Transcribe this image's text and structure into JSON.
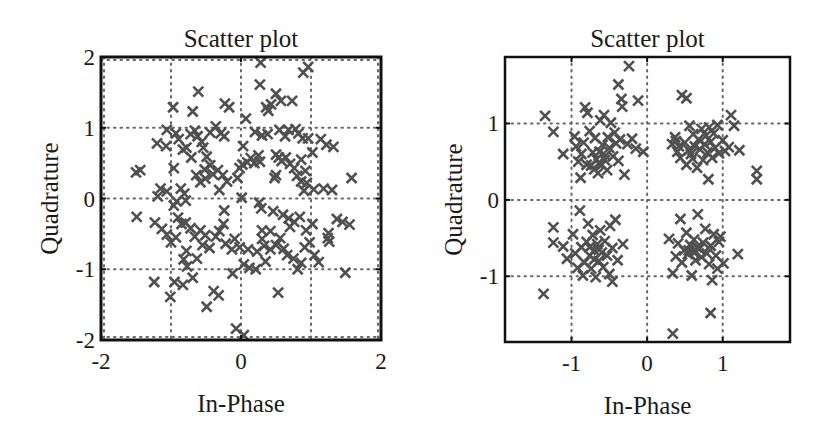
{
  "chart_data": [
    {
      "type": "scatter",
      "title": "Scatter plot",
      "xlabel": "In-Phase",
      "ylabel": "Quadrature",
      "xlim": [
        -2,
        2
      ],
      "ylim": [
        -2,
        2
      ],
      "xticks": [
        -2,
        0,
        2
      ],
      "yticks": [
        -2,
        -1,
        0,
        1,
        2
      ],
      "xtick_labels": [
        "-2",
        "0",
        "2"
      ],
      "ytick_labels": [
        "-2",
        "-1",
        "0",
        "1",
        "2"
      ],
      "grid": true,
      "grid_x": [
        -2,
        -1,
        0,
        1,
        2
      ],
      "grid_y": [
        -2,
        -1,
        0,
        1,
        2
      ],
      "grid_style": "dotted",
      "marker": "x",
      "marker_color": "#505050",
      "points": [
        [
          -0.61,
          1.51
        ],
        [
          -0.97,
          1.29
        ],
        [
          -0.69,
          1.23
        ],
        [
          -0.23,
          1.34
        ],
        [
          -0.17,
          1.29
        ],
        [
          0.07,
          1.13
        ],
        [
          0.28,
          1.92
        ],
        [
          0.89,
          1.78
        ],
        [
          0.96,
          1.86
        ],
        [
          0.27,
          1.61
        ],
        [
          0.5,
          1.48
        ],
        [
          0.57,
          1.38
        ],
        [
          0.43,
          1.33
        ],
        [
          0.39,
          1.24
        ],
        [
          0.73,
          1.38
        ],
        [
          0.36,
          1.29
        ],
        [
          -1.44,
          0.4
        ],
        [
          -1.5,
          0.37
        ],
        [
          -0.96,
          0.43
        ],
        [
          -1.06,
          0.97
        ],
        [
          -1.2,
          0.78
        ],
        [
          -1.07,
          0.74
        ],
        [
          -0.93,
          0.92
        ],
        [
          -0.89,
          0.84
        ],
        [
          -0.83,
          0.69
        ],
        [
          -0.78,
          0.72
        ],
        [
          -0.72,
          0.91
        ],
        [
          -0.66,
          0.96
        ],
        [
          -0.62,
          0.88
        ],
        [
          -0.56,
          0.8
        ],
        [
          -0.54,
          0.72
        ],
        [
          -0.71,
          0.58
        ],
        [
          -0.49,
          0.59
        ],
        [
          -0.36,
          1.02
        ],
        [
          -0.29,
          0.92
        ],
        [
          -0.24,
          0.88
        ],
        [
          -0.44,
          0.93
        ],
        [
          -0.64,
          0.33
        ],
        [
          -0.52,
          0.41
        ],
        [
          -0.44,
          0.47
        ],
        [
          -0.4,
          0.34
        ],
        [
          -0.33,
          0.4
        ],
        [
          -0.26,
          0.33
        ],
        [
          -0.2,
          0.24
        ],
        [
          -0.58,
          0.23
        ],
        [
          -0.51,
          0.28
        ],
        [
          -0.02,
          0.43
        ],
        [
          0.02,
          0.48
        ],
        [
          0.09,
          0.51
        ],
        [
          0.14,
          0.57
        ],
        [
          -0.05,
          0.29
        ],
        [
          0.03,
          0.74
        ],
        [
          0.19,
          0.5
        ],
        [
          0.25,
          0.61
        ],
        [
          0.27,
          0.52
        ],
        [
          0.2,
          0.94
        ],
        [
          0.3,
          0.89
        ],
        [
          0.38,
          0.91
        ],
        [
          0.55,
          0.97
        ],
        [
          0.63,
          0.88
        ],
        [
          0.68,
          0.97
        ],
        [
          0.78,
          0.98
        ],
        [
          0.82,
          0.92
        ],
        [
          0.88,
          0.85
        ],
        [
          0.96,
          0.85
        ],
        [
          1.14,
          0.84
        ],
        [
          1.22,
          0.76
        ],
        [
          1.32,
          0.73
        ],
        [
          1.02,
          0.65
        ],
        [
          0.5,
          0.62
        ],
        [
          0.54,
          0.58
        ],
        [
          0.58,
          0.53
        ],
        [
          0.64,
          0.58
        ],
        [
          0.7,
          0.49
        ],
        [
          0.76,
          0.43
        ],
        [
          0.86,
          0.55
        ],
        [
          0.92,
          0.39
        ],
        [
          0.8,
          0.32
        ],
        [
          0.86,
          0.24
        ],
        [
          0.94,
          0.22
        ],
        [
          1.04,
          0.13
        ],
        [
          0.9,
          0.11
        ],
        [
          1.18,
          0.14
        ],
        [
          1.3,
          0.12
        ],
        [
          0.48,
          0.29
        ],
        [
          0.5,
          0.33
        ],
        [
          1.58,
          0.29
        ],
        [
          -1.15,
          0.14
        ],
        [
          -1.19,
          0.03
        ],
        [
          -1.06,
          0.1
        ],
        [
          -0.86,
          0.14
        ],
        [
          -0.81,
          0.07
        ],
        [
          -0.79,
          -0.03
        ],
        [
          -0.92,
          -0.04
        ],
        [
          -0.96,
          -0.1
        ],
        [
          -0.31,
          0.12
        ],
        [
          0.01,
          0.01
        ],
        [
          -0.24,
          -0.17
        ],
        [
          -1.49,
          -0.26
        ],
        [
          -1.23,
          -0.34
        ],
        [
          -1.13,
          -0.43
        ],
        [
          -1.06,
          -0.51
        ],
        [
          -1.0,
          -0.62
        ],
        [
          -0.93,
          -0.55
        ],
        [
          -0.9,
          -0.27
        ],
        [
          -0.85,
          -0.36
        ],
        [
          -0.79,
          -0.34
        ],
        [
          -0.72,
          -0.42
        ],
        [
          -0.66,
          -0.54
        ],
        [
          -0.58,
          -0.45
        ],
        [
          -0.51,
          -0.52
        ],
        [
          -0.45,
          -0.7
        ],
        [
          -0.36,
          -0.54
        ],
        [
          -0.31,
          -0.46
        ],
        [
          -0.25,
          -0.36
        ],
        [
          -0.22,
          -0.64
        ],
        [
          -0.13,
          -0.72
        ],
        [
          -0.09,
          -0.57
        ],
        [
          -0.02,
          -0.69
        ],
        [
          -0.55,
          -0.66
        ],
        [
          -0.63,
          -0.85
        ],
        [
          -0.78,
          -0.74
        ],
        [
          -0.82,
          -0.86
        ],
        [
          -0.77,
          -0.96
        ],
        [
          -0.69,
          -1.12
        ],
        [
          -0.95,
          -1.18
        ],
        [
          -0.83,
          -1.22
        ],
        [
          -1.24,
          -1.18
        ],
        [
          -1.01,
          -1.39
        ],
        [
          -0.39,
          -1.31
        ],
        [
          -0.32,
          -1.37
        ],
        [
          -0.49,
          -1.53
        ],
        [
          -0.12,
          -1.06
        ],
        [
          0.04,
          -0.93
        ],
        [
          0.12,
          -0.98
        ],
        [
          0.21,
          -1.0
        ],
        [
          0.23,
          -0.75
        ],
        [
          0.1,
          -0.72
        ],
        [
          0.35,
          -0.89
        ],
        [
          0.33,
          -0.67
        ],
        [
          0.42,
          -0.72
        ],
        [
          0.5,
          -0.66
        ],
        [
          0.56,
          -0.56
        ],
        [
          0.61,
          -0.71
        ],
        [
          0.66,
          -0.8
        ],
        [
          0.75,
          -0.85
        ],
        [
          0.81,
          -1.0
        ],
        [
          0.86,
          -0.91
        ],
        [
          0.91,
          -0.69
        ],
        [
          0.98,
          -0.62
        ],
        [
          1.05,
          -0.8
        ],
        [
          1.11,
          -0.9
        ],
        [
          0.7,
          -0.4
        ],
        [
          0.76,
          -0.33
        ],
        [
          0.84,
          -0.26
        ],
        [
          0.93,
          -0.45
        ],
        [
          1.02,
          -0.36
        ],
        [
          0.6,
          -0.23
        ],
        [
          0.68,
          -0.28
        ],
        [
          0.42,
          -0.46
        ],
        [
          0.3,
          -0.45
        ],
        [
          0.46,
          -0.18
        ],
        [
          0.26,
          -0.06
        ],
        [
          0.29,
          -0.14
        ],
        [
          0.3,
          -0.57
        ],
        [
          1.25,
          -0.49
        ],
        [
          1.24,
          -0.56
        ],
        [
          1.26,
          -0.61
        ],
        [
          1.37,
          -0.29
        ],
        [
          1.45,
          -0.33
        ],
        [
          1.55,
          -0.37
        ],
        [
          1.49,
          -1.05
        ],
        [
          0.53,
          -1.33
        ],
        [
          -0.07,
          -1.84
        ],
        [
          0.04,
          -1.93
        ]
      ]
    },
    {
      "type": "scatter",
      "title": "Scatter plot",
      "xlabel": "In-Phase",
      "ylabel": "Quadrature",
      "xlim": [
        -1.88,
        1.89
      ],
      "ylim": [
        -1.86,
        1.87
      ],
      "xticks": [
        -1,
        0,
        1
      ],
      "yticks": [
        -1,
        0,
        1
      ],
      "xtick_labels": [
        "-1",
        "0",
        "1"
      ],
      "ytick_labels": [
        "-1",
        "0",
        "1"
      ],
      "grid": true,
      "grid_x": [
        -1,
        0,
        1
      ],
      "grid_y": [
        -1,
        0,
        1
      ],
      "grid_style": "dotted",
      "marker": "x",
      "marker_color": "#505050",
      "points": [
        [
          -1.35,
          1.1
        ],
        [
          -1.24,
          0.89
        ],
        [
          -1.11,
          0.6
        ],
        [
          -0.96,
          0.83
        ],
        [
          -0.94,
          0.7
        ],
        [
          -0.91,
          0.5
        ],
        [
          -0.88,
          0.29
        ],
        [
          -0.87,
          0.6
        ],
        [
          -0.84,
          0.75
        ],
        [
          -0.82,
          1.21
        ],
        [
          -0.79,
          1.14
        ],
        [
          -0.76,
          0.9
        ],
        [
          -0.72,
          0.62
        ],
        [
          -0.7,
          0.4
        ],
        [
          -0.69,
          0.81
        ],
        [
          -0.67,
          0.53
        ],
        [
          -0.65,
          0.35
        ],
        [
          -0.63,
          0.63
        ],
        [
          -0.62,
          1.04
        ],
        [
          -0.6,
          0.46
        ],
        [
          -0.59,
          0.72
        ],
        [
          -0.57,
          1.11
        ],
        [
          -0.55,
          0.58
        ],
        [
          -0.53,
          0.39
        ],
        [
          -0.52,
          0.82
        ],
        [
          -0.5,
          0.68
        ],
        [
          -0.48,
          1.01
        ],
        [
          -0.45,
          0.57
        ],
        [
          -0.43,
          0.88
        ],
        [
          -0.41,
          0.74
        ],
        [
          -0.38,
          0.51
        ],
        [
          -0.36,
          0.79
        ],
        [
          -0.34,
          1.32
        ],
        [
          -0.33,
          1.22
        ],
        [
          -0.38,
          1.51
        ],
        [
          -0.3,
          0.33
        ],
        [
          -0.26,
          0.73
        ],
        [
          -0.24,
          1.75
        ],
        [
          -0.2,
          0.8
        ],
        [
          -0.15,
          0.67
        ],
        [
          -0.12,
          1.3
        ],
        [
          -0.05,
          0.63
        ],
        [
          -0.8,
          0.46
        ],
        [
          -0.74,
          0.45
        ],
        [
          -0.64,
          0.48
        ],
        [
          -0.56,
          0.52
        ],
        [
          0.33,
          0.73
        ],
        [
          0.37,
          0.82
        ],
        [
          0.4,
          0.63
        ],
        [
          0.44,
          0.55
        ],
        [
          0.46,
          1.37
        ],
        [
          0.52,
          1.33
        ],
        [
          0.5,
          0.75
        ],
        [
          0.52,
          0.46
        ],
        [
          0.56,
          0.97
        ],
        [
          0.58,
          0.6
        ],
        [
          0.61,
          0.86
        ],
        [
          0.63,
          0.7
        ],
        [
          0.66,
          0.42
        ],
        [
          0.68,
          0.79
        ],
        [
          0.7,
          0.66
        ],
        [
          0.72,
          0.93
        ],
        [
          0.74,
          0.52
        ],
        [
          0.76,
          0.73
        ],
        [
          0.78,
          0.84
        ],
        [
          0.8,
          0.62
        ],
        [
          0.82,
          0.95
        ],
        [
          0.84,
          0.76
        ],
        [
          0.86,
          0.55
        ],
        [
          0.88,
          0.87
        ],
        [
          0.9,
          0.68
        ],
        [
          0.93,
          0.98
        ],
        [
          0.95,
          0.61
        ],
        [
          1.0,
          0.78
        ],
        [
          1.03,
          0.64
        ],
        [
          1.08,
          0.69
        ],
        [
          1.11,
          1.11
        ],
        [
          1.15,
          0.97
        ],
        [
          1.22,
          0.65
        ],
        [
          0.81,
          0.27
        ],
        [
          1.45,
          0.38
        ],
        [
          1.45,
          0.27
        ],
        [
          0.38,
          0.77
        ],
        [
          0.42,
          0.7
        ],
        [
          0.6,
          0.54
        ],
        [
          0.55,
          0.65
        ],
        [
          -1.37,
          -1.23
        ],
        [
          -1.24,
          -0.36
        ],
        [
          -1.24,
          -0.56
        ],
        [
          -1.11,
          -0.61
        ],
        [
          -1.06,
          -0.77
        ],
        [
          -0.98,
          -0.45
        ],
        [
          -0.95,
          -0.7
        ],
        [
          -0.92,
          -0.89
        ],
        [
          -0.89,
          -0.14
        ],
        [
          -0.87,
          -0.62
        ],
        [
          -0.85,
          -0.99
        ],
        [
          -0.83,
          -0.82
        ],
        [
          -0.8,
          -0.55
        ],
        [
          -0.78,
          -0.31
        ],
        [
          -0.76,
          -0.73
        ],
        [
          -0.74,
          -0.9
        ],
        [
          -0.72,
          -0.46
        ],
        [
          -0.7,
          -0.66
        ],
        [
          -0.68,
          -1.01
        ],
        [
          -0.66,
          -0.58
        ],
        [
          -0.64,
          -0.8
        ],
        [
          -0.62,
          -0.4
        ],
        [
          -0.6,
          -0.69
        ],
        [
          -0.58,
          -0.88
        ],
        [
          -0.56,
          -0.54
        ],
        [
          -0.53,
          -0.73
        ],
        [
          -0.5,
          -0.97
        ],
        [
          -0.49,
          -0.34
        ],
        [
          -0.46,
          -0.63
        ],
        [
          -0.42,
          -0.26
        ],
        [
          -0.39,
          -0.79
        ],
        [
          -0.32,
          -0.58
        ],
        [
          -0.46,
          -1.07
        ],
        [
          -0.76,
          -0.62
        ],
        [
          -0.7,
          -0.78
        ],
        [
          -0.64,
          -0.65
        ],
        [
          0.29,
          -0.51
        ],
        [
          0.34,
          -0.96
        ],
        [
          0.38,
          -0.74
        ],
        [
          0.41,
          -0.57
        ],
        [
          0.44,
          -0.25
        ],
        [
          0.46,
          -0.82
        ],
        [
          0.49,
          -0.66
        ],
        [
          0.52,
          -0.43
        ],
        [
          0.54,
          -0.71
        ],
        [
          0.57,
          -0.59
        ],
        [
          0.59,
          -0.99
        ],
        [
          0.62,
          -0.52
        ],
        [
          0.64,
          -0.79
        ],
        [
          0.67,
          -0.19
        ],
        [
          0.69,
          -0.64
        ],
        [
          0.72,
          -0.75
        ],
        [
          0.74,
          -0.56
        ],
        [
          0.77,
          -0.38
        ],
        [
          0.79,
          -0.7
        ],
        [
          0.82,
          -0.84
        ],
        [
          0.84,
          -0.6
        ],
        [
          0.86,
          -1.05
        ],
        [
          0.88,
          -0.45
        ],
        [
          0.91,
          -0.73
        ],
        [
          0.93,
          -0.9
        ],
        [
          0.95,
          -0.55
        ],
        [
          0.97,
          -0.48
        ],
        [
          1.01,
          -0.83
        ],
        [
          1.2,
          -0.71
        ],
        [
          0.55,
          -0.66
        ],
        [
          0.61,
          -0.68
        ],
        [
          0.66,
          -0.62
        ],
        [
          0.84,
          -1.48
        ],
        [
          0.34,
          -1.75
        ]
      ]
    }
  ]
}
